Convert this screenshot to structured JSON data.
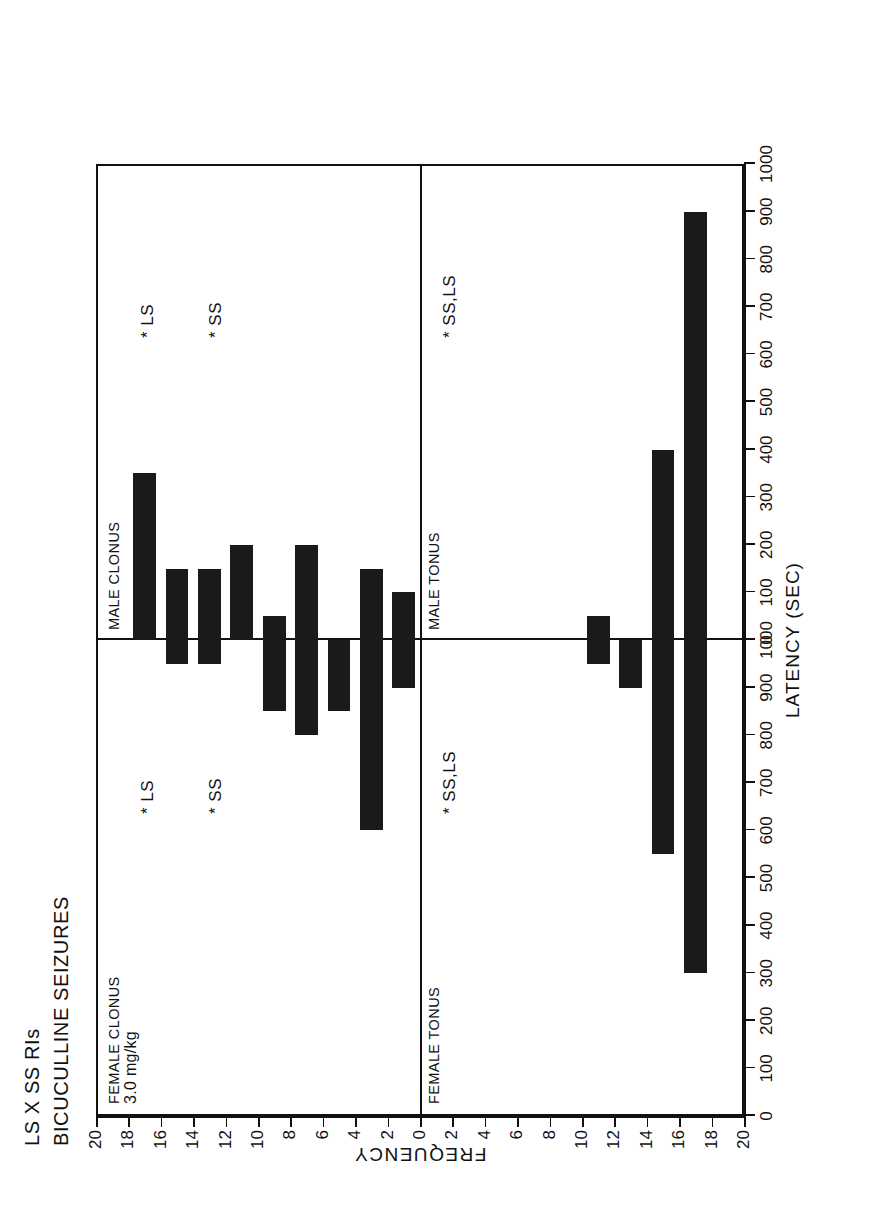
{
  "figure": {
    "title_line1": "LS X SS RIs",
    "title_line2": "BICUCULLINE SEIZURES"
  },
  "axes": {
    "x_title": "LATENCY (SEC)",
    "y_title": "FREQUENCY",
    "x_ticks_female": [
      "0",
      "100",
      "200",
      "300",
      "400",
      "500",
      "600",
      "700",
      "800",
      "900",
      "1000"
    ],
    "x_ticks_male": [
      "0",
      "100",
      "200",
      "300",
      "400",
      "500",
      "600",
      "700",
      "800",
      "900",
      "1000"
    ],
    "y_ticks_clonus": [
      "20",
      "18",
      "16",
      "14",
      "12",
      "10",
      "8",
      "6",
      "4",
      "2",
      "0"
    ],
    "y_ticks_tonus": [
      "0",
      "2",
      "4",
      "6",
      "8",
      "10",
      "12",
      "14",
      "16",
      "18",
      "20"
    ]
  },
  "panels": {
    "female_clonus": {
      "label": "FEMALE CLONUS",
      "dose": "3.0 mg/kg",
      "sig_ss": "*  SS",
      "sig_ls": "*  LS"
    },
    "female_tonus": {
      "label": "FEMALE TONUS",
      "sig": "*  SS,LS"
    },
    "male_clonus": {
      "label": "MALE CLONUS",
      "sig_ss": "*  SS",
      "sig_ls": "*  LS"
    },
    "male_tonus": {
      "label": "MALE TONUS",
      "sig": "*  SS,LS"
    }
  },
  "chart_data": {
    "type": "bar",
    "subtitle": "3.0 mg/kg bicuculline",
    "xlabel": "LATENCY (SEC)",
    "ylabel": "FREQUENCY",
    "orientation": "horizontal-mirrored-quadrants",
    "xlim": [
      0,
      1000
    ],
    "ylim": [
      0,
      20
    ],
    "x_bin_centers": [
      50,
      150,
      250,
      350,
      450,
      550,
      650,
      750,
      850,
      950
    ],
    "x_bin_labels": [
      "0-100",
      "100-200",
      "200-300",
      "300-400",
      "400-500",
      "500-600",
      "600-700",
      "700-800",
      "800-900",
      "900-1000"
    ],
    "grid": false,
    "legend": null,
    "panels": [
      {
        "name": "FEMALE CLONUS",
        "position": "bottom-left",
        "bar_direction": "frequency increases leftward",
        "values": [
          2,
          8,
          3,
          4,
          3,
          0,
          1,
          1,
          0,
          0
        ]
      },
      {
        "name": "FEMALE TONUS",
        "position": "bottom-right",
        "bar_direction": "frequency increases rightward",
        "values": [
          0,
          0,
          0,
          0,
          0,
          1,
          2,
          9,
          14,
          0
        ]
      },
      {
        "name": "MALE CLONUS",
        "position": "top-left",
        "bar_direction": "frequency increases leftward",
        "values": [
          2,
          3,
          0,
          4,
          1,
          4,
          3,
          3,
          7,
          0
        ]
      },
      {
        "name": "MALE TONUS",
        "position": "top-right",
        "bar_direction": "frequency increases rightward",
        "values": [
          0,
          0,
          0,
          0,
          0,
          1,
          0,
          8,
          18,
          0
        ]
      }
    ],
    "annotations": [
      {
        "panel": "FEMALE CLONUS",
        "text": "*  SS"
      },
      {
        "panel": "FEMALE CLONUS",
        "text": "*  LS"
      },
      {
        "panel": "FEMALE TONUS",
        "text": "*  SS,LS"
      },
      {
        "panel": "MALE CLONUS",
        "text": "*  SS"
      },
      {
        "panel": "MALE CLONUS",
        "text": "*  LS"
      },
      {
        "panel": "MALE TONUS",
        "text": "*  SS,LS"
      }
    ]
  }
}
